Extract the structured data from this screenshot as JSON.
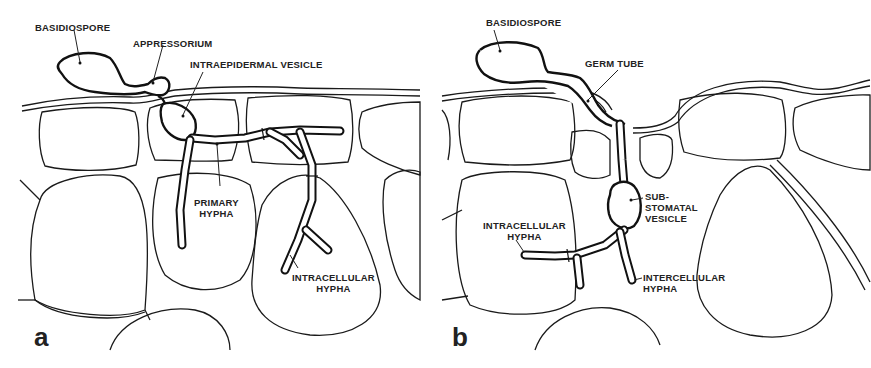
{
  "figure": {
    "panel_a": {
      "letter": "a",
      "labels": {
        "basidiospore": "BASIDIOSPORE",
        "appressorium": "APPRESSORIUM",
        "intraepidermal_vesicle": "INTRAEPIDERMAL VESICLE",
        "primary_hypha_1": "PRIMARY",
        "primary_hypha_2": "HYPHA",
        "intracellular_hypha_1": "INTRACELLULAR",
        "intracellular_hypha_2": "HYPHA"
      }
    },
    "panel_b": {
      "letter": "b",
      "labels": {
        "basidiospore": "BASIDIOSPORE",
        "germ_tube": "GERM TUBE",
        "substomatal_vesicle_1": "SUB-",
        "substomatal_vesicle_2": "STOMATAL",
        "substomatal_vesicle_3": "VESICLE",
        "intracellular_hypha_1": "INTRACELLULAR",
        "intracellular_hypha_2": "HYPHA",
        "intercellular_hypha_1": "INTERCELLULAR",
        "intercellular_hypha_2": "HYPHA"
      }
    }
  }
}
